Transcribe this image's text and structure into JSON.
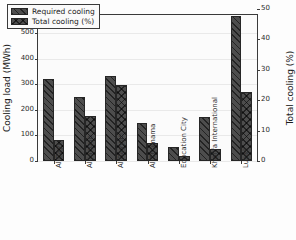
{
  "chart_data": {
    "type": "bar",
    "title": "",
    "xlabel": "",
    "ylabel": "Cooling load (MWh)",
    "y2label": "Total cooling (%)",
    "ylim": [
      0,
      570
    ],
    "y2lim": [
      0,
      48
    ],
    "yticks": [
      0,
      100,
      200,
      300,
      400,
      500
    ],
    "y2ticks": [
      0,
      10,
      20,
      30,
      40,
      50
    ],
    "grid": true,
    "legend_position": "upper left",
    "categories": [
      "Al Bayt",
      "Al Janoub",
      "Al Rayyan",
      "Al Thumama",
      "Education City",
      "Khalifa International",
      "Lusail"
    ],
    "series": [
      {
        "name": "Required cooling",
        "axis": "left",
        "unit": "MWh",
        "hatch": "diagonal",
        "color": "#4d4d4d",
        "values": [
          320,
          250,
          332,
          147,
          55,
          170,
          568
        ]
      },
      {
        "name": "Total cooling (%)",
        "axis": "right",
        "unit": "%",
        "hatch": "cross",
        "color": "#4d4d4d",
        "values": [
          7.0,
          14.8,
          24.9,
          5.8,
          1.6,
          4.0,
          22.8
        ]
      }
    ]
  },
  "legend": {
    "items": [
      {
        "label": "Required cooling"
      },
      {
        "label": "Total cooling (%)"
      }
    ]
  },
  "axes": {
    "left_title": "Cooling load (MWh)",
    "right_title": "Total cooling (%)",
    "left_ticks": [
      "0",
      "100",
      "200",
      "300",
      "400",
      "500"
    ],
    "right_ticks": [
      "0",
      "10",
      "20",
      "30",
      "40",
      "50"
    ]
  }
}
